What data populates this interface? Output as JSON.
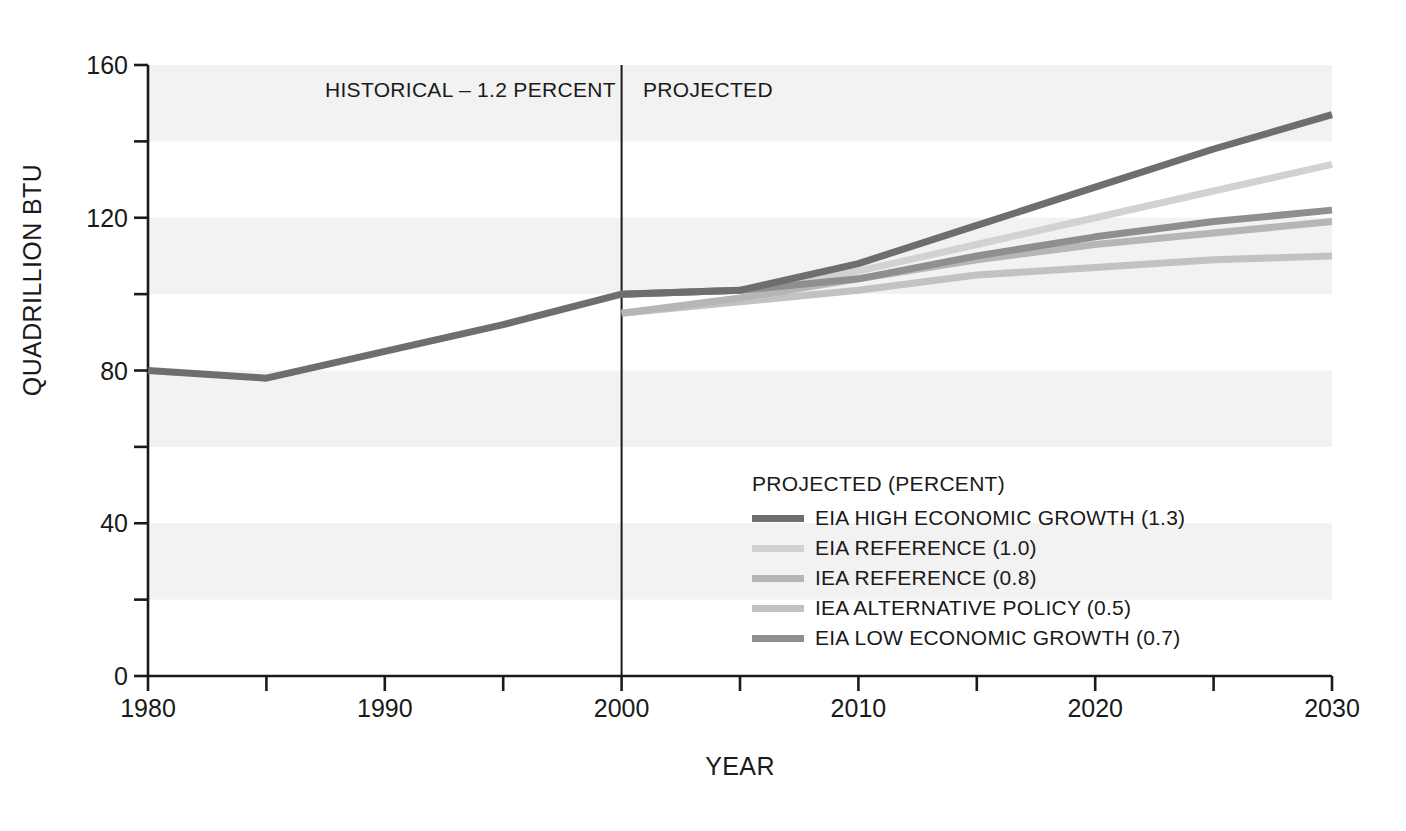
{
  "chart_data": {
    "type": "line",
    "title": "",
    "xlabel": "YEAR",
    "ylabel": "QUADRILLION BTU",
    "xlim": [
      1980,
      2030
    ],
    "ylim": [
      0,
      160
    ],
    "ytick_labels": [
      "0",
      "40",
      "80",
      "120",
      "160"
    ],
    "ytick_values": [
      0,
      40,
      80,
      120,
      160
    ],
    "yminor_values": [
      20,
      60,
      100,
      140
    ],
    "xtick_labels": [
      "1980",
      "1990",
      "2000",
      "2030"
    ],
    "xtick_values": [
      1980,
      1990,
      2000,
      2010,
      2020,
      2030
    ],
    "xtick_all_labels": [
      "1980",
      "1990",
      "2000",
      "2010",
      "2020",
      "2030"
    ],
    "xminor_values": [
      1985,
      1995,
      2005,
      2015,
      2025
    ],
    "grid": "horizontal-bands",
    "legend_position": "inside-lower-right",
    "divider_x": 2000,
    "annotations": [
      {
        "name": "historical",
        "text": "HISTORICAL – 1.2 PERCENT",
        "x": 1990
      },
      {
        "name": "projected",
        "text": "PROJECTED",
        "x": 2004
      }
    ],
    "series": [
      {
        "name": "HISTORICAL",
        "label": "HISTORICAL – 1.2 PERCENT",
        "color": "#6e6e6e",
        "x": [
          1980,
          1985,
          1990,
          1995,
          2000
        ],
        "values": [
          80,
          78,
          85,
          92,
          100
        ]
      },
      {
        "name": "EIA HIGH ECONOMIC GROWTH",
        "label": "EIA HIGH ECONOMIC GROWTH (1.3)",
        "percent": 1.3,
        "color": "#6e6e6e",
        "x": [
          2000,
          2005,
          2010,
          2015,
          2020,
          2025,
          2030
        ],
        "values": [
          100,
          101,
          108,
          118,
          128,
          138,
          147
        ]
      },
      {
        "name": "EIA REFERENCE",
        "label": "EIA REFERENCE (1.0)",
        "percent": 1.0,
        "color": "#d2d2d2",
        "x": [
          2000,
          2005,
          2010,
          2015,
          2020,
          2025,
          2030
        ],
        "values": [
          100,
          101,
          106,
          113,
          120,
          127,
          134
        ]
      },
      {
        "name": "IEA REFERENCE",
        "label": "IEA REFERENCE (0.8)",
        "percent": 0.8,
        "color": "#b6b6b6",
        "x": [
          2000,
          2005,
          2010,
          2015,
          2020,
          2025,
          2030
        ],
        "values": [
          95,
          99,
          104,
          109,
          113,
          116,
          119
        ]
      },
      {
        "name": "IEA ALTERNATIVE POLICY",
        "label": "IEA ALTERNATIVE POLICY (0.5)",
        "percent": 0.5,
        "color": "#c2c2c2",
        "x": [
          2000,
          2005,
          2010,
          2015,
          2020,
          2025,
          2030
        ],
        "values": [
          95,
          98,
          101,
          105,
          107,
          109,
          110
        ]
      },
      {
        "name": "EIA LOW ECONOMIC GROWTH",
        "label": "EIA LOW ECONOMIC GROWTH (0.7)",
        "percent": 0.7,
        "color": "#8f8f8f",
        "x": [
          2000,
          2005,
          2010,
          2015,
          2020,
          2025,
          2030
        ],
        "values": [
          100,
          101,
          104,
          110,
          115,
          119,
          122
        ]
      }
    ]
  },
  "legend": {
    "title": "PROJECTED (PERCENT)",
    "items": [
      {
        "label": "EIA HIGH ECONOMIC GROWTH (1.3)",
        "color": "#6e6e6e"
      },
      {
        "label": "EIA REFERENCE (1.0)",
        "color": "#d2d2d2"
      },
      {
        "label": "IEA REFERENCE (0.8)",
        "color": "#b6b6b6"
      },
      {
        "label": "IEA ALTERNATIVE POLICY (0.5)",
        "color": "#c2c2c2"
      },
      {
        "label": "EIA LOW ECONOMIC GROWTH (0.7)",
        "color": "#8f8f8f"
      }
    ]
  },
  "style": {
    "axis_color": "#1a1a1a",
    "band_color": "#f2f2f2",
    "plot_background": "#ffffff",
    "divider_color": "#1a1a1a"
  }
}
